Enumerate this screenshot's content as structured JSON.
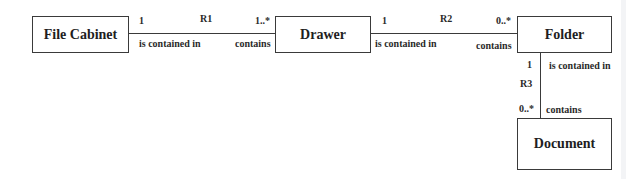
{
  "diagram": {
    "type": "uml-class-association",
    "entities": [
      {
        "id": "file_cabinet",
        "label": "File Cabinet"
      },
      {
        "id": "drawer",
        "label": "Drawer"
      },
      {
        "id": "folder",
        "label": "Folder"
      },
      {
        "id": "document",
        "label": "Document"
      }
    ],
    "relationships": [
      {
        "name": "R1",
        "from": "File Cabinet",
        "to": "Drawer",
        "from_multiplicity": "1",
        "to_multiplicity": "1..*",
        "from_role": "is contained in",
        "to_role": "contains"
      },
      {
        "name": "R2",
        "from": "Drawer",
        "to": "Folder",
        "from_multiplicity": "1",
        "to_multiplicity": "0..*",
        "from_role": "is contained in",
        "to_role": "contains"
      },
      {
        "name": "R3",
        "from": "Folder",
        "to": "Document",
        "from_multiplicity": "1",
        "to_multiplicity": "0..*",
        "from_role": "is contained in",
        "to_role": "contains"
      }
    ]
  }
}
